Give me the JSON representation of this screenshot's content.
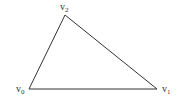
{
  "diagram": {
    "type": "triangle",
    "stroke_color": "#333333",
    "vertices": [
      {
        "label": "v",
        "subscript": "0",
        "x": 29,
        "y": 89
      },
      {
        "label": "v",
        "subscript": "1",
        "x": 157,
        "y": 89
      },
      {
        "label": "v",
        "subscript": "2",
        "x": 65,
        "y": 15
      }
    ]
  }
}
